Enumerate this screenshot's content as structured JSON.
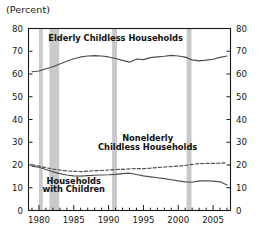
{
  "figure": {
    "axis_title": "(Percent)",
    "background": "#ffffff",
    "frame_color": "#1a1a1a",
    "recession_band_color": "#c9c9c9"
  },
  "chart_data": {
    "type": "line",
    "title": "",
    "subtitle": "",
    "xlabel": "",
    "ylabel": "(Percent)",
    "xlim": [
      1978.5,
      2007.5
    ],
    "ylim": [
      0,
      80
    ],
    "yticks": [
      0,
      10,
      20,
      30,
      40,
      50,
      60,
      70,
      80
    ],
    "ytick_labels": [
      "0",
      "10",
      "20",
      "30",
      "40",
      "50",
      "60",
      "70",
      "80"
    ],
    "y_axis_both_sides": true,
    "xticks_major": [
      1980,
      1985,
      1990,
      1995,
      2000,
      2005
    ],
    "xtick_labels": [
      "1980",
      "1985",
      "1990",
      "1995",
      "2000",
      "2005"
    ],
    "xticks_minor_step": 1,
    "grid": false,
    "legend": "inline-annotations",
    "annotations": [
      {
        "text": "Elderly Childless Households",
        "x": 1991.0,
        "y": 74.5
      },
      {
        "text": "Nonelderly",
        "x": 1995.6,
        "y": 30.5
      },
      {
        "text": "Childless Households",
        "x": 1995.6,
        "y": 26.8
      },
      {
        "text": "Households",
        "x": 1985.0,
        "y": 11.6
      },
      {
        "text": "with Children",
        "x": 1985.0,
        "y": 8.0
      }
    ],
    "shaded_regions": [
      {
        "name": "recession-1980",
        "x0": 1980.0,
        "x1": 1980.55
      },
      {
        "name": "recession-1981-1982",
        "x0": 1981.5,
        "x1": 1982.9
      },
      {
        "name": "recession-1990-1991",
        "x0": 1990.5,
        "x1": 1991.2
      },
      {
        "name": "recession-2001",
        "x0": 2001.2,
        "x1": 2001.9
      }
    ],
    "x": [
      1979,
      1980,
      1981,
      1982,
      1983,
      1984,
      1985,
      1986,
      1987,
      1988,
      1989,
      1990,
      1991,
      1992,
      1993,
      1994,
      1995,
      1996,
      1997,
      1998,
      1999,
      2000,
      2001,
      2002,
      2003,
      2004,
      2005,
      2006,
      2007
    ],
    "series": [
      {
        "name": "Elderly Childless Households",
        "style": "solid",
        "color": "#4d4d4d",
        "values": [
          61.0,
          61.3,
          62.3,
          63.2,
          64.4,
          65.6,
          66.7,
          67.5,
          67.9,
          68.1,
          67.9,
          67.5,
          66.8,
          66.0,
          65.2,
          66.6,
          66.3,
          67.2,
          67.5,
          67.8,
          68.2,
          67.9,
          67.4,
          66.2,
          65.8,
          66.1,
          66.5,
          67.3,
          67.9
        ]
      },
      {
        "name": "Nonelderly Childless Households",
        "style": "dashed",
        "color": "#4d4d4d",
        "values": [
          20.1,
          19.5,
          18.8,
          18.2,
          17.8,
          17.4,
          17.2,
          17.1,
          17.3,
          17.5,
          17.6,
          17.8,
          18.0,
          18.1,
          18.3,
          18.4,
          18.4,
          18.6,
          18.9,
          19.1,
          19.3,
          19.5,
          19.8,
          20.3,
          20.6,
          20.7,
          20.7,
          20.8,
          21.0
        ]
      },
      {
        "name": "Households with Children",
        "style": "solid",
        "color": "#4d4d4d",
        "values": [
          19.5,
          19.0,
          18.0,
          17.0,
          16.2,
          15.6,
          15.2,
          15.1,
          15.3,
          15.5,
          15.6,
          15.7,
          15.9,
          16.2,
          16.4,
          15.8,
          15.2,
          14.8,
          14.4,
          14.0,
          13.5,
          13.0,
          12.6,
          12.4,
          13.0,
          13.1,
          12.9,
          12.6,
          11.2
        ]
      }
    ]
  }
}
